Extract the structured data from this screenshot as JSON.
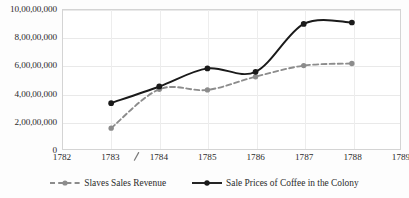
{
  "chart_data": {
    "type": "line",
    "title": "",
    "subtitle": "",
    "xlabel": "",
    "ylabel": "",
    "x": [
      1783,
      1784,
      1785,
      1786,
      1787,
      1788
    ],
    "xticks": [
      "1782",
      "1783",
      "1784",
      "1785",
      "1786",
      "1787",
      "1788",
      "1789"
    ],
    "xlim": [
      1782,
      1789
    ],
    "yticks": [
      "0",
      "2,00,00,000",
      "4,00,00,000",
      "6,00,00,000",
      "8,00,00,000",
      "10,00,00,000"
    ],
    "ytickvalues": [
      0,
      20000000,
      40000000,
      60000000,
      80000000,
      100000000
    ],
    "ylim": [
      0,
      100000000
    ],
    "grid": "horizontal-and-vertical",
    "legend_position": "bottom",
    "series": [
      {
        "name": "Slaves Sales Revenue",
        "style": "dashed",
        "color": "#8c8c8c",
        "marker": "circle",
        "values": [
          15000000,
          43000000,
          42500000,
          52000000,
          60000000,
          61500000
        ]
      },
      {
        "name": "Sale Prices of Coffee in the Colony",
        "style": "solid",
        "color": "#1a1a1a",
        "marker": "circle",
        "values": [
          33000000,
          45000000,
          58000000,
          55500000,
          90000000,
          91000000
        ]
      }
    ]
  },
  "legend": {
    "items": [
      {
        "label": "Slaves Sales Revenue"
      },
      {
        "label": "Sale Prices of Coffee in the Colony"
      }
    ]
  },
  "colors": {
    "series_slaves": "#8c8c8c",
    "series_coffee": "#1a1a1a",
    "grid": "#e9e9e9",
    "axis_border": "#d4d4d4",
    "text": "#2b2b2b",
    "background": "#ffffff"
  }
}
